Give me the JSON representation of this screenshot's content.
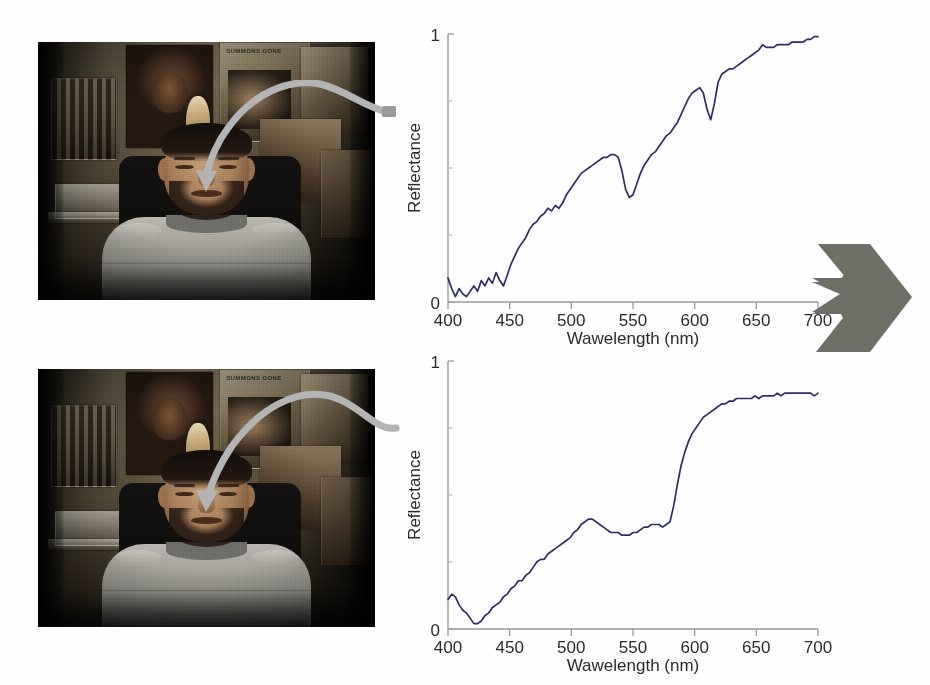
{
  "figure": {
    "background_color": "#ffffff"
  },
  "panels": [
    {
      "id": "photo-top",
      "name": "subject-photo-upper",
      "caption": "",
      "scene": {
        "subject": "seated man in light gray t-shirt",
        "background": "bedroom wall covered with posters",
        "posters": [
          {
            "name": "poster-face",
            "text": ""
          },
          {
            "name": "poster-bodybuilders",
            "text": ""
          },
          {
            "name": "poster-summons",
            "text": "SUMMONS GONE"
          },
          {
            "name": "poster-collage-right",
            "text": ""
          }
        ],
        "shelf": "white wire shelf at lower left",
        "bottle": "gold bottle on shelf"
      },
      "annotation": {
        "name": "pointer-arrow-forehead",
        "color": "#b4b4b4",
        "target": "left cheek / upper cheekbone"
      }
    },
    {
      "id": "photo-bottom",
      "name": "subject-photo-lower",
      "caption": "",
      "scene": {
        "subject": "seated man in light gray t-shirt",
        "background": "bedroom wall covered with posters",
        "posters": [
          {
            "name": "poster-face",
            "text": ""
          },
          {
            "name": "poster-bodybuilders",
            "text": ""
          },
          {
            "name": "poster-summons",
            "text": "SUMMONS GONE"
          },
          {
            "name": "poster-collage-right",
            "text": ""
          }
        ],
        "shelf": "white wire shelf at lower left",
        "bottle": "gold bottle on shelf"
      },
      "annotation": {
        "name": "pointer-arrow-cheek",
        "color": "#b4b4b4",
        "target": "left cheek"
      }
    }
  ],
  "chevron": {
    "name": "double-chevron-arrow",
    "direction": "right",
    "color": "#6e6e66"
  },
  "chart_data": [
    {
      "id": "spectrum-top",
      "type": "line",
      "title": "",
      "xlabel": "Wawelength (nm)",
      "ylabel": "Reflectance",
      "xlim": [
        400,
        700
      ],
      "ylim": [
        0,
        1
      ],
      "xticks": [
        400,
        450,
        500,
        550,
        600,
        650,
        700
      ],
      "xticklabels": [
        "400",
        "450",
        "500",
        "550",
        "600",
        "650",
        "700"
      ],
      "yticks": [
        0,
        1
      ],
      "yticklabels": [
        "0",
        "1"
      ],
      "grid": false,
      "legend": null,
      "line_color": "#2c2f66",
      "series": [
        {
          "name": "reflectance",
          "x": [
            400,
            403,
            406,
            409,
            412,
            415,
            418,
            421,
            424,
            427,
            430,
            433,
            436,
            439,
            442,
            445,
            448,
            451,
            454,
            457,
            460,
            463,
            466,
            469,
            472,
            475,
            478,
            481,
            484,
            487,
            490,
            493,
            496,
            499,
            502,
            505,
            508,
            511,
            514,
            517,
            520,
            523,
            526,
            529,
            532,
            535,
            538,
            541,
            544,
            547,
            550,
            553,
            556,
            559,
            562,
            565,
            568,
            571,
            574,
            577,
            580,
            583,
            586,
            589,
            592,
            595,
            598,
            601,
            604,
            607,
            610,
            613,
            616,
            619,
            622,
            625,
            628,
            631,
            634,
            637,
            640,
            643,
            646,
            649,
            652,
            655,
            658,
            661,
            664,
            667,
            670,
            673,
            676,
            679,
            682,
            685,
            688,
            691,
            694,
            697,
            700
          ],
          "y": [
            0.09,
            0.05,
            0.02,
            0.05,
            0.03,
            0.02,
            0.04,
            0.06,
            0.04,
            0.08,
            0.06,
            0.09,
            0.07,
            0.11,
            0.08,
            0.06,
            0.1,
            0.14,
            0.17,
            0.2,
            0.22,
            0.24,
            0.27,
            0.29,
            0.3,
            0.32,
            0.33,
            0.35,
            0.34,
            0.36,
            0.35,
            0.37,
            0.4,
            0.42,
            0.44,
            0.46,
            0.48,
            0.49,
            0.5,
            0.51,
            0.52,
            0.53,
            0.54,
            0.54,
            0.55,
            0.55,
            0.54,
            0.49,
            0.42,
            0.39,
            0.4,
            0.44,
            0.48,
            0.51,
            0.53,
            0.55,
            0.56,
            0.58,
            0.6,
            0.62,
            0.63,
            0.65,
            0.67,
            0.7,
            0.73,
            0.76,
            0.78,
            0.79,
            0.8,
            0.78,
            0.72,
            0.68,
            0.74,
            0.82,
            0.85,
            0.86,
            0.87,
            0.87,
            0.88,
            0.89,
            0.9,
            0.91,
            0.92,
            0.93,
            0.94,
            0.96,
            0.95,
            0.95,
            0.95,
            0.96,
            0.96,
            0.96,
            0.96,
            0.97,
            0.97,
            0.97,
            0.97,
            0.98,
            0.98,
            0.99,
            0.99
          ]
        }
      ],
      "annotations": [
        {
          "label": "hemoglobin dip",
          "x": 545,
          "y": 0.4
        },
        {
          "label": "hemoglobin dip",
          "x": 615,
          "y": 0.68
        }
      ]
    },
    {
      "id": "spectrum-bottom",
      "type": "line",
      "title": "",
      "xlabel": "Wawelength (nm)",
      "ylabel": "Reflectance",
      "xlim": [
        400,
        700
      ],
      "ylim": [
        0,
        1
      ],
      "xticks": [
        400,
        450,
        500,
        550,
        600,
        650,
        700
      ],
      "xticklabels": [
        "400",
        "450",
        "500",
        "550",
        "600",
        "650",
        "700"
      ],
      "yticks": [
        0,
        1
      ],
      "yticklabels": [
        "0",
        "1"
      ],
      "grid": false,
      "legend": null,
      "line_color": "#2c2f66",
      "series": [
        {
          "name": "reflectance",
          "x": [
            400,
            403,
            406,
            409,
            412,
            415,
            418,
            421,
            424,
            427,
            430,
            433,
            436,
            439,
            442,
            445,
            448,
            451,
            454,
            457,
            460,
            463,
            466,
            469,
            472,
            475,
            478,
            481,
            484,
            487,
            490,
            493,
            496,
            499,
            502,
            505,
            508,
            511,
            514,
            517,
            520,
            523,
            526,
            529,
            532,
            535,
            538,
            541,
            544,
            547,
            550,
            553,
            556,
            559,
            562,
            565,
            568,
            571,
            574,
            577,
            580,
            583,
            586,
            589,
            592,
            595,
            598,
            601,
            604,
            607,
            610,
            613,
            616,
            619,
            622,
            625,
            628,
            631,
            634,
            637,
            640,
            643,
            646,
            649,
            652,
            655,
            658,
            661,
            664,
            667,
            670,
            673,
            676,
            679,
            682,
            685,
            688,
            691,
            694,
            697,
            700
          ],
          "y": [
            0.11,
            0.13,
            0.12,
            0.09,
            0.07,
            0.06,
            0.04,
            0.02,
            0.02,
            0.03,
            0.05,
            0.06,
            0.08,
            0.09,
            0.1,
            0.12,
            0.13,
            0.15,
            0.16,
            0.18,
            0.18,
            0.2,
            0.21,
            0.23,
            0.25,
            0.26,
            0.26,
            0.28,
            0.29,
            0.3,
            0.31,
            0.32,
            0.33,
            0.34,
            0.36,
            0.37,
            0.39,
            0.4,
            0.41,
            0.41,
            0.4,
            0.39,
            0.38,
            0.37,
            0.36,
            0.36,
            0.36,
            0.35,
            0.35,
            0.35,
            0.36,
            0.36,
            0.37,
            0.38,
            0.38,
            0.39,
            0.39,
            0.39,
            0.38,
            0.39,
            0.4,
            0.46,
            0.54,
            0.61,
            0.66,
            0.7,
            0.73,
            0.75,
            0.77,
            0.79,
            0.8,
            0.81,
            0.82,
            0.83,
            0.84,
            0.84,
            0.85,
            0.85,
            0.86,
            0.86,
            0.86,
            0.86,
            0.86,
            0.87,
            0.86,
            0.87,
            0.87,
            0.87,
            0.87,
            0.88,
            0.87,
            0.88,
            0.88,
            0.88,
            0.88,
            0.88,
            0.88,
            0.88,
            0.88,
            0.87,
            0.88
          ]
        }
      ],
      "annotations": [
        {
          "label": "broad rise at 580-620 nm",
          "x": 595,
          "y": 0.66
        }
      ]
    }
  ]
}
